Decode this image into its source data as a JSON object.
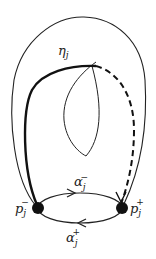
{
  "diagram": {
    "labels": {
      "eta": "η",
      "eta_sub": "j",
      "alpha_minus": "α",
      "alpha_minus_sub": "j",
      "alpha_minus_sup": "−",
      "alpha_plus": "α",
      "alpha_plus_sub": "j",
      "alpha_plus_sup": "+",
      "p_minus": "p",
      "p_minus_sub": "j",
      "p_minus_sup": "−",
      "p_plus": "p",
      "p_plus_sub": "j",
      "p_plus_sup": "+"
    },
    "colors": {
      "stroke": "#222222",
      "background": "#ffffff"
    }
  }
}
